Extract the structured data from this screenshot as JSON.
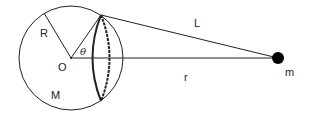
{
  "diagram": {
    "type": "physics-gravitation",
    "labels": {
      "radius": "R",
      "center": "O",
      "sphere_mass": "M",
      "angle": "θ",
      "slant_distance": "L",
      "center_distance": "r",
      "point_mass": "m"
    },
    "colors": {
      "stroke": "#222222",
      "background": "#ffffff",
      "point_mass": "#000000"
    }
  }
}
